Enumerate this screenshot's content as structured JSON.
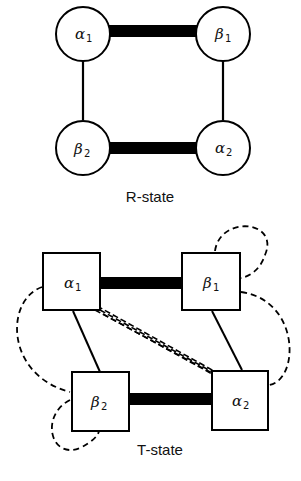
{
  "diagram": {
    "r_state": {
      "caption": "R-state",
      "nodes": [
        {
          "id": "alpha1",
          "symbol": "α",
          "subscript": "1",
          "shape": "circle"
        },
        {
          "id": "beta1",
          "symbol": "β",
          "subscript": "1",
          "shape": "circle"
        },
        {
          "id": "beta2",
          "symbol": "β",
          "subscript": "2",
          "shape": "circle"
        },
        {
          "id": "alpha2",
          "symbol": "α",
          "subscript": "2",
          "shape": "circle"
        }
      ],
      "edges": [
        {
          "from": "alpha1",
          "to": "beta1",
          "style": "thick"
        },
        {
          "from": "beta2",
          "to": "alpha2",
          "style": "thick"
        },
        {
          "from": "alpha1",
          "to": "beta2",
          "style": "thin"
        },
        {
          "from": "beta1",
          "to": "alpha2",
          "style": "thin"
        }
      ]
    },
    "t_state": {
      "caption": "T-state",
      "nodes": [
        {
          "id": "alpha1",
          "symbol": "α",
          "subscript": "1",
          "shape": "square"
        },
        {
          "id": "beta1",
          "symbol": "β",
          "subscript": "1",
          "shape": "square"
        },
        {
          "id": "beta2",
          "symbol": "β",
          "subscript": "2",
          "shape": "square"
        },
        {
          "id": "alpha2",
          "symbol": "α",
          "subscript": "2",
          "shape": "square"
        }
      ],
      "edges": [
        {
          "from": "alpha1",
          "to": "beta1",
          "style": "thick"
        },
        {
          "from": "beta2",
          "to": "alpha2",
          "style": "thick"
        },
        {
          "from": "alpha1",
          "to": "beta2",
          "style": "thin"
        },
        {
          "from": "beta1",
          "to": "alpha2",
          "style": "thin"
        },
        {
          "from": "alpha1",
          "to": "alpha2",
          "style": "triple-dashed"
        },
        {
          "from": "alpha1",
          "to": "beta2",
          "style": "dashed-loop"
        },
        {
          "from": "beta1",
          "to": "alpha2",
          "style": "dashed-loop"
        },
        {
          "from": "beta1",
          "to": "beta1",
          "style": "dashed-self-loop"
        },
        {
          "from": "beta2",
          "to": "beta2",
          "style": "dashed-self-loop"
        }
      ]
    }
  }
}
